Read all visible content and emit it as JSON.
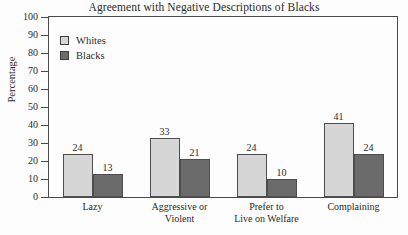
{
  "chart_data": {
    "type": "bar",
    "title": "Agreement with Negative Descriptions of Blacks",
    "xlabel": "",
    "ylabel": "Percentage",
    "ylim": [
      0,
      100
    ],
    "yticks": [
      0,
      10,
      20,
      30,
      40,
      50,
      60,
      70,
      80,
      90,
      100
    ],
    "grid": false,
    "legend_position": "top-left-inside",
    "categories": [
      "Lazy",
      "Aggressive or Violent",
      "Prefer to Live on Welfare",
      "Complaining"
    ],
    "category_lines": [
      [
        "Lazy"
      ],
      [
        "Aggressive or",
        "Violent"
      ],
      [
        "Prefer to",
        "Live on Welfare"
      ],
      [
        "Complaining"
      ]
    ],
    "series": [
      {
        "name": "Whites",
        "color": "#d6d6d6",
        "values": [
          24,
          33,
          24,
          41
        ]
      },
      {
        "name": "Blacks",
        "color": "#6b6b6b",
        "values": [
          13,
          21,
          10,
          24
        ]
      }
    ]
  },
  "axis": {
    "tick_labels": [
      "100",
      "90",
      "80",
      "70",
      "60",
      "50",
      "40",
      "30",
      "20",
      "10",
      "0"
    ]
  },
  "legend": {
    "items": [
      {
        "label": "Whites"
      },
      {
        "label": "Blacks"
      }
    ]
  }
}
